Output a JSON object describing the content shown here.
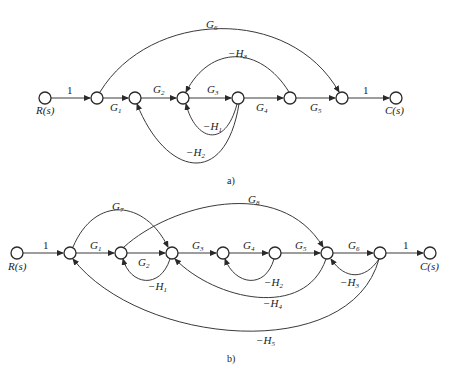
{
  "diagram_a": {
    "caption": "a)",
    "input_label": "R(s)",
    "output_label": "C(s)",
    "nodes": [
      "R(s)",
      "n1",
      "n2",
      "n3",
      "n4",
      "n5",
      "n6",
      "C(s)"
    ],
    "branches": [
      {
        "from": "R(s)",
        "to": "n1",
        "gain": "1"
      },
      {
        "from": "n1",
        "to": "n2",
        "gain": "G1"
      },
      {
        "from": "n2",
        "to": "n3",
        "gain": "G2"
      },
      {
        "from": "n3",
        "to": "n4",
        "gain": "G3"
      },
      {
        "from": "n4",
        "to": "n5",
        "gain": "G4"
      },
      {
        "from": "n5",
        "to": "n6",
        "gain": "G5"
      },
      {
        "from": "n6",
        "to": "C(s)",
        "gain": "1"
      },
      {
        "from": "n1",
        "to": "n6",
        "gain": "G6"
      },
      {
        "from": "n5",
        "to": "n3",
        "gain": "-H3"
      },
      {
        "from": "n4",
        "to": "n3",
        "gain": "-H1"
      },
      {
        "from": "n4",
        "to": "n2",
        "gain": "-H2"
      }
    ],
    "labels": {
      "one_in": "1",
      "one_out": "1",
      "G": "G",
      "H": "H",
      "minus": "−",
      "s1": "1",
      "s2": "2",
      "s3": "3",
      "s4": "4",
      "s5": "5",
      "s6": "6"
    }
  },
  "diagram_b": {
    "caption": "b)",
    "input_label": "R(s)",
    "output_label": "C(s)",
    "nodes": [
      "R(s)",
      "n1",
      "n2",
      "n3",
      "n4",
      "n5",
      "n6",
      "n7",
      "C(s)"
    ],
    "branches": [
      {
        "from": "R(s)",
        "to": "n1",
        "gain": "1"
      },
      {
        "from": "n1",
        "to": "n2",
        "gain": "G1"
      },
      {
        "from": "n2",
        "to": "n3",
        "gain": "G2"
      },
      {
        "from": "n3",
        "to": "n4",
        "gain": "G3"
      },
      {
        "from": "n4",
        "to": "n5",
        "gain": "G4"
      },
      {
        "from": "n5",
        "to": "n6",
        "gain": "G5"
      },
      {
        "from": "n6",
        "to": "n7",
        "gain": "G6"
      },
      {
        "from": "n7",
        "to": "C(s)",
        "gain": "1"
      },
      {
        "from": "n1",
        "to": "n3",
        "gain": "G7"
      },
      {
        "from": "n2",
        "to": "n6",
        "gain": "G8"
      },
      {
        "from": "n3",
        "to": "n2",
        "gain": "-H1"
      },
      {
        "from": "n5",
        "to": "n4",
        "gain": "-H2"
      },
      {
        "from": "n7",
        "to": "n6",
        "gain": "-H3"
      },
      {
        "from": "n6",
        "to": "n3",
        "gain": "-H4"
      },
      {
        "from": "n7",
        "to": "n1",
        "gain": "-H5"
      }
    ],
    "labels": {
      "one_in": "1",
      "one_out": "1",
      "G": "G",
      "H": "H",
      "minus": "−",
      "s1": "1",
      "s2": "2",
      "s3": "3",
      "s4": "4",
      "s5": "5",
      "s6": "6",
      "s7": "7",
      "s8": "8"
    }
  },
  "colors": {
    "stroke": "#2a2a2a",
    "background": "#ffffff"
  }
}
